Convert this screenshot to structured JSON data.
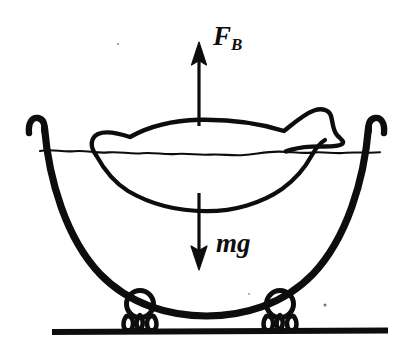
{
  "figure": {
    "domain": "Diagram",
    "background_color": "#ffffff",
    "ink_color": "#0d0d0d",
    "width": 413,
    "height": 354
  },
  "labels": {
    "buoyant_force": {
      "symbol": "F",
      "subscript": "B",
      "full": "F_B",
      "meaning": "buoyant force",
      "direction": "up"
    },
    "weight": {
      "symbol": "mg",
      "full": "mg",
      "meaning": "weight (mass times gravity)",
      "direction": "down"
    }
  },
  "arrows": [
    {
      "name": "buoyant-force-arrow",
      "label": "F_B",
      "direction": "up",
      "tail": [
        199,
        125
      ],
      "head": [
        199,
        52
      ]
    },
    {
      "name": "weight-arrow",
      "label": "mg",
      "direction": "down",
      "tail": [
        199,
        192
      ],
      "head": [
        199,
        263
      ]
    }
  ],
  "elements": {
    "bowl": "bowl-with-curled-rim",
    "water_line": "wavy-water-surface-line",
    "floating_object": "floating-boat-shape",
    "feet": [
      "claw-foot-left",
      "claw-foot-right"
    ],
    "ground": "ground-line"
  }
}
